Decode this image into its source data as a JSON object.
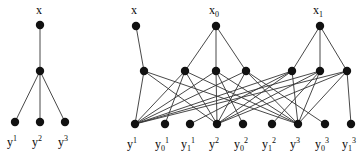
{
  "figure": {
    "background": "#ffffff",
    "node_color": "#111111",
    "edge_color": "#333333",
    "node_radius": 4.2,
    "edge_width": 0.9,
    "width": 363,
    "height": 161
  },
  "left_graph": {
    "name": "left-graph",
    "nodes": [
      {
        "id": "Lx",
        "cx": 40,
        "cy": 25
      },
      {
        "id": "Lm",
        "cx": 40,
        "cy": 71
      },
      {
        "id": "Ly1",
        "cx": 15,
        "cy": 122
      },
      {
        "id": "Ly2",
        "cx": 40,
        "cy": 122
      },
      {
        "id": "Ly3",
        "cx": 65,
        "cy": 122
      }
    ],
    "edges": [
      [
        "Lx",
        "Lm"
      ],
      [
        "Lm",
        "Ly1"
      ],
      [
        "Lm",
        "Ly2"
      ],
      [
        "Lm",
        "Ly3"
      ]
    ],
    "labels": [
      {
        "id": "left-label-x",
        "base": "x",
        "sup": "",
        "sub": "",
        "x": 36,
        "y": 4
      },
      {
        "id": "left-label-y1",
        "base": "y",
        "sup": "1",
        "sub": "",
        "x": 7,
        "y": 136
      },
      {
        "id": "left-label-y2",
        "base": "y",
        "sup": "2",
        "sub": "",
        "x": 32,
        "y": 136
      },
      {
        "id": "left-label-y3",
        "base": "y",
        "sup": "3",
        "sub": "",
        "x": 58,
        "y": 136
      }
    ]
  },
  "right_graph": {
    "name": "right-graph",
    "nodes": [
      {
        "id": "Rx",
        "cx": 136,
        "cy": 26
      },
      {
        "id": "Rx0",
        "cx": 216,
        "cy": 26
      },
      {
        "id": "Rx1",
        "cx": 320,
        "cy": 26
      },
      {
        "id": "Ma",
        "cx": 144,
        "cy": 71
      },
      {
        "id": "Mb",
        "cx": 185,
        "cy": 71
      },
      {
        "id": "Mc",
        "cx": 216,
        "cy": 71
      },
      {
        "id": "Md",
        "cx": 246,
        "cy": 71
      },
      {
        "id": "Me",
        "cx": 292,
        "cy": 71
      },
      {
        "id": "Mf",
        "cx": 320,
        "cy": 71
      },
      {
        "id": "Mg",
        "cx": 347,
        "cy": 71
      },
      {
        "id": "B1",
        "cx": 135,
        "cy": 124
      },
      {
        "id": "B2",
        "cx": 165,
        "cy": 124
      },
      {
        "id": "B3",
        "cx": 190,
        "cy": 124
      },
      {
        "id": "B4",
        "cx": 217,
        "cy": 124
      },
      {
        "id": "B5",
        "cx": 243,
        "cy": 124
      },
      {
        "id": "B6",
        "cx": 272,
        "cy": 124
      },
      {
        "id": "B7",
        "cx": 298,
        "cy": 124
      },
      {
        "id": "B8",
        "cx": 325,
        "cy": 124
      },
      {
        "id": "B9",
        "cx": 351,
        "cy": 124
      }
    ],
    "edges": [
      [
        "Rx",
        "Ma"
      ],
      [
        "Rx0",
        "Mb"
      ],
      [
        "Rx0",
        "Mc"
      ],
      [
        "Rx0",
        "Md"
      ],
      [
        "Rx1",
        "Me"
      ],
      [
        "Rx1",
        "Mf"
      ],
      [
        "Rx1",
        "Mg"
      ],
      [
        "Ma",
        "B1"
      ],
      [
        "Ma",
        "B4"
      ],
      [
        "Ma",
        "B7"
      ],
      [
        "Mb",
        "B1"
      ],
      [
        "Mb",
        "B4"
      ],
      [
        "Mb",
        "B7"
      ],
      [
        "Mc",
        "B1"
      ],
      [
        "Mc",
        "B4"
      ],
      [
        "Mc",
        "B7"
      ],
      [
        "Md",
        "B1"
      ],
      [
        "Md",
        "B4"
      ],
      [
        "Md",
        "B7"
      ],
      [
        "Me",
        "B1"
      ],
      [
        "Me",
        "B4"
      ],
      [
        "Me",
        "B7"
      ],
      [
        "Mf",
        "B1"
      ],
      [
        "Mf",
        "B4"
      ],
      [
        "Mf",
        "B7"
      ],
      [
        "Mg",
        "B1"
      ],
      [
        "Mg",
        "B4"
      ],
      [
        "Mg",
        "B7"
      ],
      [
        "Mb",
        "B2"
      ],
      [
        "Mc",
        "B5"
      ],
      [
        "Md",
        "B8"
      ],
      [
        "Me",
        "B3"
      ],
      [
        "Mf",
        "B6"
      ],
      [
        "Mg",
        "B9"
      ]
    ],
    "labels": [
      {
        "id": "right-label-x",
        "base": "x",
        "sup": "",
        "sub": "",
        "x": 131,
        "y": 4
      },
      {
        "id": "right-label-x0",
        "base": "x",
        "sup": "",
        "sub": "0",
        "x": 209,
        "y": 4
      },
      {
        "id": "right-label-x1",
        "base": "x",
        "sup": "",
        "sub": "1",
        "x": 313,
        "y": 4
      },
      {
        "id": "right-label-y1",
        "base": "y",
        "sup": "1",
        "sub": "",
        "x": 127,
        "y": 138
      },
      {
        "id": "right-label-y01",
        "base": "y",
        "sup": "1",
        "sub": "0",
        "x": 155,
        "y": 138
      },
      {
        "id": "right-label-y11",
        "base": "y",
        "sup": "1",
        "sub": "1",
        "x": 181,
        "y": 138
      },
      {
        "id": "right-label-y2",
        "base": "y",
        "sup": "2",
        "sub": "",
        "x": 209,
        "y": 138
      },
      {
        "id": "right-label-y02",
        "base": "y",
        "sup": "2",
        "sub": "0",
        "x": 234,
        "y": 138
      },
      {
        "id": "right-label-y12",
        "base": "y",
        "sup": "2",
        "sub": "1",
        "x": 262,
        "y": 138
      },
      {
        "id": "right-label-y3",
        "base": "y",
        "sup": "3",
        "sub": "",
        "x": 290,
        "y": 138
      },
      {
        "id": "right-label-y03",
        "base": "y",
        "sup": "3",
        "sub": "0",
        "x": 315,
        "y": 138
      },
      {
        "id": "right-label-y13",
        "base": "y",
        "sup": "3",
        "sub": "1",
        "x": 342,
        "y": 138
      }
    ]
  }
}
